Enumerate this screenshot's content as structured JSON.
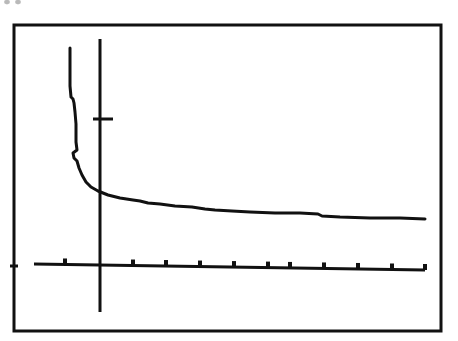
{
  "figure": {
    "kind": "line-plot",
    "background_color": "#ffffff",
    "ink_color": "#111111",
    "artifact_label": "scan-artifact-top-left"
  },
  "frame": {
    "label": "plot-frame",
    "x": 14,
    "y": 25,
    "width": 427,
    "height": 306,
    "stroke_width": 3,
    "color": "#111111"
  },
  "axes": {
    "y_axis": {
      "label": "y-axis",
      "x": 100,
      "y_top": 39,
      "y_bottom": 312,
      "stroke_width": 3,
      "color": "#111111",
      "tick": {
        "label": "y-axis-tick",
        "y": 119,
        "x_start": 93,
        "x_end": 113,
        "stroke_width": 3
      }
    },
    "x_axis": {
      "label": "x-axis",
      "x_start": 34,
      "x_end": 425,
      "y_start": 264,
      "y_end": 270,
      "stroke_width": 3,
      "color": "#111111",
      "left_edge_tick": {
        "label": "frame-left-tick",
        "x": 14,
        "y": 266,
        "length": 8
      },
      "tick_positions": [
        65,
        133,
        166,
        200,
        234,
        268,
        290,
        324,
        358,
        392,
        425
      ],
      "tick_height": 5,
      "tick_width": 4
    }
  },
  "chart_data": {
    "type": "line",
    "title": "",
    "xlabel": "",
    "ylabel": "",
    "grid": false,
    "legend": null,
    "annotations": [],
    "axis_origin_px": [
      100,
      267
    ],
    "xlim_px": [
      34,
      425
    ],
    "ylim_px": [
      39,
      312
    ],
    "x_tick_count": 11,
    "y_tick_count": 1,
    "series": [
      {
        "name": "decay-curve",
        "points_px": [
          [
            70,
            48
          ],
          [
            70,
            86
          ],
          [
            71,
            97
          ],
          [
            73,
            99
          ],
          [
            74,
            103
          ],
          [
            75,
            112
          ],
          [
            76,
            124
          ],
          [
            76,
            142
          ],
          [
            77,
            150
          ],
          [
            73,
            153
          ],
          [
            74,
            158
          ],
          [
            77,
            161
          ],
          [
            79,
            168
          ],
          [
            82,
            175
          ],
          [
            86,
            182
          ],
          [
            91,
            187
          ],
          [
            98,
            191
          ],
          [
            108,
            195
          ],
          [
            120,
            198
          ],
          [
            133,
            200
          ],
          [
            140,
            201
          ],
          [
            148,
            203
          ],
          [
            160,
            204
          ],
          [
            175,
            206
          ],
          [
            192,
            207
          ],
          [
            205,
            209
          ],
          [
            215,
            210
          ],
          [
            232,
            211
          ],
          [
            250,
            212
          ],
          [
            275,
            213
          ],
          [
            300,
            213
          ],
          [
            318,
            214
          ],
          [
            322,
            216
          ],
          [
            340,
            217
          ],
          [
            370,
            218
          ],
          [
            400,
            218
          ],
          [
            425,
            219
          ]
        ]
      }
    ]
  }
}
